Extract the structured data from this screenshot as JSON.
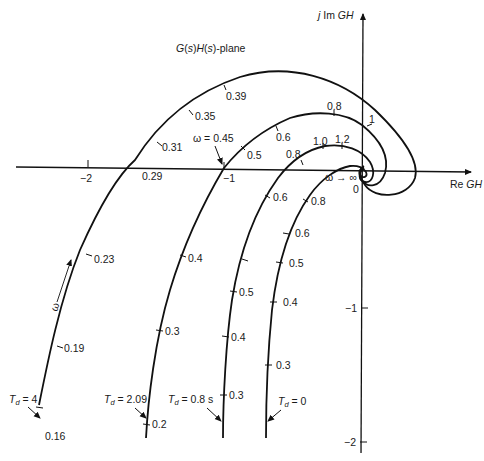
{
  "diagram": {
    "title": "G(s)H(s)-plane",
    "axes": {
      "x_label_prefix": "Re",
      "x_label_var": "GH",
      "y_label_prefix": "j Im",
      "y_label_var": "GH",
      "x_ticks": [
        "−2",
        "−1"
      ],
      "origin_label": "0",
      "y_ticks": [
        "−1",
        "−2"
      ]
    },
    "annotations": {
      "omega_045": "ω = 0.45",
      "omega_inf": "ω → ∞",
      "omega_dir": "ω"
    },
    "curves": [
      {
        "name": "Td=4",
        "label": "T",
        "label_sub": "d",
        "label_value": " = 4",
        "freq_labels": [
          "0.16",
          "0.19",
          "0.23",
          "0.29",
          "0.31",
          "0.35",
          "0.39",
          "1"
        ]
      },
      {
        "name": "Td=2.09",
        "label": "T",
        "label_sub": "d",
        "label_value": " = 2.09",
        "freq_labels": [
          "0.2",
          "0.3",
          "0.4",
          "0.5",
          "0.6",
          "0.8"
        ]
      },
      {
        "name": "Td=0.8s",
        "label": "T",
        "label_sub": "d",
        "label_value": " = 0.8 s",
        "freq_labels": [
          "0.3",
          "0.4",
          "0.5",
          "0.6",
          "0.8",
          "1.0",
          "1.2"
        ]
      },
      {
        "name": "Td=0",
        "label": "T",
        "label_sub": "d",
        "label_value": " = 0",
        "freq_labels": [
          "0.3",
          "0.4",
          "0.5",
          "0.6",
          "0.8"
        ]
      }
    ]
  }
}
